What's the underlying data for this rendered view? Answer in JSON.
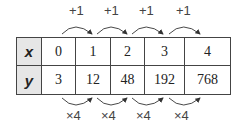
{
  "table": {
    "rows": [
      {
        "label": "x",
        "values": [
          "0",
          "1",
          "2",
          "3",
          "4"
        ]
      },
      {
        "label": "y",
        "values": [
          "3",
          "12",
          "48",
          "192",
          "768"
        ]
      }
    ]
  },
  "top_arrows": [
    "+1",
    "+1",
    "+1",
    "+1"
  ],
  "bottom_arrows": [
    "×4",
    "×4",
    "×4",
    "×4"
  ]
}
